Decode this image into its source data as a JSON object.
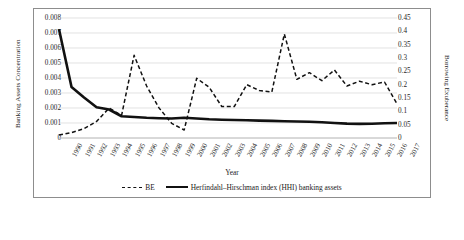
{
  "axes": {
    "y_left_title": "Banking Assets Concentration",
    "y_right_title": "Borrowing Exuberance",
    "x_title": "Year",
    "y_left_ticks": [
      "0.008",
      "0.007",
      "0.006",
      "0.005",
      "0.004",
      "0.003",
      "0.002",
      "0.001",
      "0"
    ],
    "y_right_ticks": [
      "0.45",
      "0.4",
      "0.35",
      "0.3",
      "0.25",
      "0.2",
      "0.15",
      "0.1",
      "0.05",
      "0"
    ]
  },
  "legend": {
    "items": [
      {
        "label": "BE",
        "style": "dashed"
      },
      {
        "label": "Herfindahl–Hirschman index (HHI) banking assets",
        "style": "solid"
      }
    ]
  },
  "chart_data": {
    "type": "line",
    "title": "",
    "xlabel": "Year",
    "ylabel": "Banking Assets Concentration",
    "y2label": "Borrowing Exuberance",
    "grid": true,
    "legend_position": "bottom",
    "ylim": [
      0,
      0.008
    ],
    "y2lim": [
      0,
      0.45
    ],
    "categories": [
      "1990",
      "1991",
      "1992",
      "1993",
      "1994",
      "1995",
      "1996",
      "1997",
      "1998",
      "1999",
      "2000",
      "2001",
      "2002",
      "2003",
      "2004",
      "2005",
      "2006",
      "2007",
      "2008",
      "2009",
      "2010",
      "2011",
      "2012",
      "2013",
      "2014",
      "2015",
      "2016",
      "2017"
    ],
    "series": [
      {
        "name": "BE",
        "axis": "right",
        "style": "dashed",
        "values": [
          0.011,
          0.02,
          0.035,
          0.062,
          0.112,
          0.085,
          0.31,
          0.195,
          0.112,
          0.055,
          0.03,
          0.224,
          0.19,
          0.118,
          0.118,
          0.2,
          0.178,
          0.172,
          0.39,
          0.22,
          0.245,
          0.215,
          0.255,
          0.195,
          0.213,
          0.2,
          0.21,
          0.128
        ]
      },
      {
        "name": "Herfindahl–Hirschman index (HHI) banking assets",
        "axis": "left",
        "style": "solid",
        "values": [
          0.00725,
          0.0034,
          0.0027,
          0.00205,
          0.0019,
          0.00145,
          0.0014,
          0.00135,
          0.00132,
          0.0013,
          0.00135,
          0.0013,
          0.00125,
          0.00122,
          0.0012,
          0.00118,
          0.00116,
          0.00114,
          0.00112,
          0.0011,
          0.00108,
          0.00105,
          0.001,
          0.00096,
          0.00094,
          0.00095,
          0.00098,
          0.001
        ]
      }
    ]
  }
}
